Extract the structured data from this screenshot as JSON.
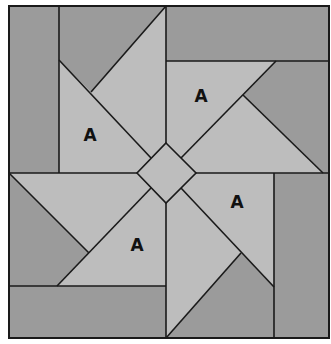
{
  "diagram": {
    "type": "pinwheel-quilt-block",
    "colors": {
      "background": "#ffffff",
      "dark_fill": "#9b9b9b",
      "light_fill": "#bdbdbd",
      "line": "#1a1a1a",
      "label": "#111111"
    },
    "labels": [
      {
        "text": "A",
        "x": 90,
        "y": 141
      },
      {
        "text": "A",
        "x": 201,
        "y": 102
      },
      {
        "text": "A",
        "x": 237,
        "y": 208
      },
      {
        "text": "A",
        "x": 137,
        "y": 251
      }
    ]
  }
}
